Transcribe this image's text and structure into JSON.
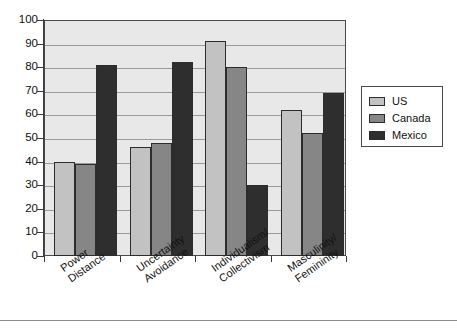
{
  "chart_data": {
    "type": "bar",
    "title": "",
    "subtitle": "",
    "xlabel": "",
    "ylabel": "",
    "ylim": [
      0,
      100
    ],
    "ytick_step": 10,
    "yticks": [
      0,
      10,
      20,
      30,
      40,
      50,
      60,
      70,
      80,
      90,
      100
    ],
    "grid": true,
    "grid_axis": "y",
    "legend_position": "right",
    "categories": [
      "Power Distance",
      "Uncertainty Avoidance",
      "Individualism/ Collectivism",
      "Masculinity/ Femininity"
    ],
    "category_lines": [
      [
        "Power",
        "Distance"
      ],
      [
        "Uncertainty",
        "Avoidance"
      ],
      [
        "Individualism/",
        "Collectivism"
      ],
      [
        "Masculinity/",
        "Femininity"
      ]
    ],
    "series": [
      {
        "name": "US",
        "color": "#c2c2c2",
        "values": [
          40,
          46,
          91,
          62
        ]
      },
      {
        "name": "Canada",
        "color": "#868686",
        "values": [
          39,
          48,
          80,
          52
        ]
      },
      {
        "name": "Mexico",
        "color": "#2e2e2e",
        "values": [
          81,
          82,
          30,
          69
        ]
      }
    ]
  },
  "legend": {
    "items": [
      {
        "label": "US",
        "color": "#c2c2c2"
      },
      {
        "label": "Canada",
        "color": "#868686"
      },
      {
        "label": "Mexico",
        "color": "#2e2e2e"
      }
    ]
  },
  "colors": {
    "plot_background": "#e8e8e8",
    "page_background": "#ffffff",
    "gridline": "#9a9a9a",
    "axis": "#3a3a3a",
    "text": "#111111"
  }
}
